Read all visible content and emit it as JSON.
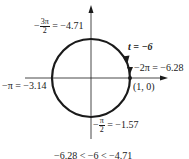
{
  "diagram": {
    "type": "unit-circle",
    "center_point_label": "(1, 0)",
    "parameter_label": "t = −6",
    "labels": {
      "top": {
        "sign": "−",
        "num": "3π",
        "den": "2",
        "value": "= −4.71"
      },
      "left": {
        "text": "−π = −3.14"
      },
      "right": {
        "text": "−2π = −6.28"
      },
      "bottom": {
        "sign": "−",
        "num": "π",
        "den": "2",
        "value": "= −1.57"
      }
    },
    "inequality": "−6.28 < −6 < −4.71",
    "colors": {
      "stroke": "#1a1a1a",
      "background": "#ffffff"
    }
  }
}
